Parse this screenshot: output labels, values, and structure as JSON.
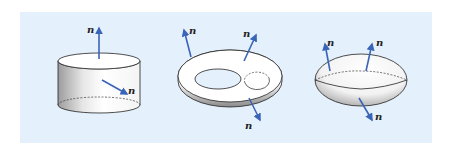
{
  "figure": {
    "background": "#ffffff",
    "panel_color": "#e4f0fb",
    "arrow_color": "#3a64b8",
    "outline_color": "#222222",
    "shapes": [
      {
        "name": "cylinder",
        "normals": [
          {
            "label": "n",
            "direction": "up (top face)"
          },
          {
            "label": "n",
            "direction": "outward (side face)"
          }
        ]
      },
      {
        "name": "torus",
        "normals": [
          {
            "label": "n",
            "direction": "outward upper-left"
          },
          {
            "label": "n",
            "direction": "outward upper-right"
          },
          {
            "label": "n",
            "direction": "outward lower"
          }
        ]
      },
      {
        "name": "ellipsoid",
        "normals": [
          {
            "label": "n",
            "direction": "outward upper-left"
          },
          {
            "label": "n",
            "direction": "outward upper-right"
          },
          {
            "label": "n",
            "direction": "outward lower"
          }
        ]
      }
    ]
  }
}
